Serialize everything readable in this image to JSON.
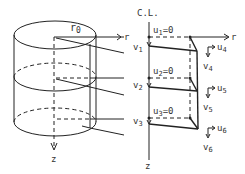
{
  "diagram": {
    "cylinder": {
      "radius_label": "r0",
      "radius_label_main": "r",
      "radius_label_sub": "0",
      "axis_label": "z"
    },
    "mesh": {
      "centerline_label": "C.L.",
      "r_axis_label_left": "r",
      "r_axis_label_right": "r",
      "z_axis_label": "z",
      "nodes_left": [
        {
          "name": "v",
          "sub": "1"
        },
        {
          "name": "v",
          "sub": "2"
        },
        {
          "name": "v",
          "sub": "3"
        }
      ],
      "constraints": [
        {
          "name": "u",
          "sub": "1",
          "value": "=0"
        },
        {
          "name": "u",
          "sub": "2",
          "value": "=0"
        },
        {
          "name": "u",
          "sub": "3",
          "value": "=0"
        }
      ],
      "nodes_right": [
        {
          "u": "u",
          "u_sub": "4",
          "v": "v",
          "v_sub": "4"
        },
        {
          "u": "u",
          "u_sub": "5",
          "v": "v",
          "v_sub": "5"
        },
        {
          "u": "u",
          "u_sub": "6",
          "v": "v",
          "v_sub": "6"
        }
      ]
    }
  }
}
